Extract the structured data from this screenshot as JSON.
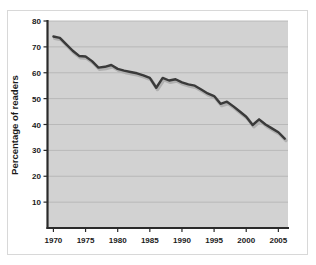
{
  "chart_data": {
    "type": "line",
    "title": "",
    "xlabel": "",
    "ylabel": "Percentage of readers",
    "xlim": [
      1969,
      2006.5
    ],
    "ylim": [
      0,
      80
    ],
    "xticks": [
      1970,
      1975,
      1980,
      1985,
      1990,
      1995,
      2000,
      2005
    ],
    "yticks": [
      10,
      20,
      30,
      40,
      50,
      60,
      70,
      80
    ],
    "xtick_labels": [
      "1970",
      "1975",
      "1980",
      "1985",
      "1990",
      "1995",
      "2000",
      "2005"
    ],
    "ytick_labels": [
      "10",
      "20",
      "30",
      "40",
      "50",
      "60",
      "70",
      "80"
    ],
    "grid": true,
    "legend": null,
    "series": [
      {
        "name": "Percentage of readers",
        "color": "#3a3a3a",
        "shadow_color": "#b0b0b0",
        "x": [
          1970,
          1971,
          1972,
          1973,
          1974,
          1975,
          1976,
          1977,
          1978,
          1979,
          1980,
          1981,
          1982,
          1983,
          1984,
          1985,
          1986,
          1987,
          1988,
          1989,
          1990,
          1991,
          1992,
          1993,
          1994,
          1995,
          1996,
          1997,
          1998,
          1999,
          2000,
          2001,
          2002,
          2003,
          2004,
          2005,
          2006
        ],
        "y": [
          74.0,
          73.5,
          71.0,
          68.5,
          66.5,
          66.3,
          64.5,
          62.0,
          62.3,
          63.0,
          61.5,
          60.8,
          60.3,
          59.8,
          59.0,
          58.0,
          54.2,
          58.0,
          57.0,
          57.5,
          56.3,
          55.5,
          55.0,
          53.5,
          52.0,
          51.0,
          48.0,
          48.8,
          47.0,
          45.0,
          43.0,
          39.8,
          42.0,
          40.0,
          38.5,
          37.0,
          34.5
        ]
      }
    ]
  },
  "axis": {
    "ylabel": "Percentage of readers"
  },
  "colors": {
    "plot_background": "#d2d2d2",
    "grid_line": "#b6b6b6",
    "axis_line": "#2a2a2a",
    "line": "#3a3a3a",
    "line_shadow": "#b0b0b0",
    "page_background": "#ffffff",
    "figure_border": "#d8d8d8",
    "tick_text": "#1a1a1a"
  }
}
